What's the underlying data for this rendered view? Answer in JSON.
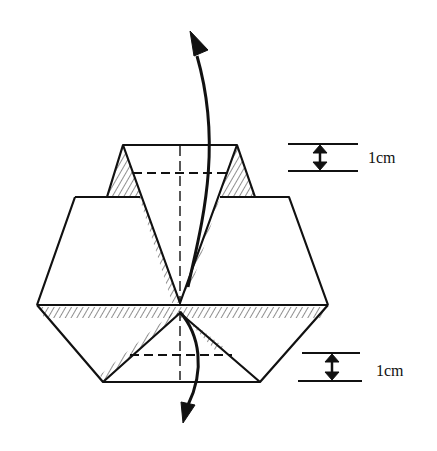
{
  "diagram": {
    "type": "origami-fold-instruction",
    "annotations": [
      {
        "id": "top-measure",
        "label": "1cm"
      },
      {
        "id": "bottom-measure",
        "label": "1cm"
      }
    ],
    "elements": [
      "paper-model",
      "center-crease-dash",
      "fold-guide-dash-top",
      "fold-guide-dash-bottom",
      "fold-arrow-up",
      "fold-arrow-down",
      "hatched-shading"
    ],
    "colors": {
      "ink": "#111111",
      "background": "#ffffff"
    }
  }
}
